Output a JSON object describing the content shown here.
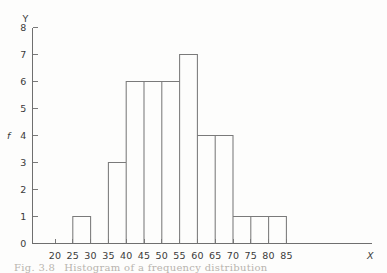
{
  "figure": {
    "caption_prefix": "Fig. 3.8",
    "caption_text": "Histogram of a frequency distribution",
    "background_color": "#fdfdfc",
    "line_color": "#7a7a7a"
  },
  "axes": {
    "y_axis_name": "Y",
    "y_series_name": "f",
    "x_axis_name": "X",
    "y_ticks": [
      "0",
      "1",
      "2",
      "3",
      "4",
      "5",
      "6",
      "7",
      "8"
    ],
    "x_ticks": [
      "20",
      "25",
      "30",
      "35",
      "40",
      "45",
      "50",
      "55",
      "60",
      "65",
      "70",
      "75",
      "80",
      "85"
    ]
  },
  "chart_data": {
    "type": "bar",
    "xlabel": "X",
    "ylabel": "f",
    "grid": false,
    "legend": "none",
    "bar_style": "outline",
    "bin_width": 5,
    "categories": [
      "20-25",
      "25-30",
      "30-35",
      "35-40",
      "40-45",
      "45-50",
      "50-55",
      "55-60",
      "60-65",
      "65-70",
      "70-75",
      "75-80",
      "80-85"
    ],
    "bin_edges": [
      20,
      25,
      30,
      35,
      40,
      45,
      50,
      55,
      60,
      65,
      70,
      75,
      80,
      85
    ],
    "values": [
      0,
      1,
      0,
      3,
      6,
      6,
      6,
      7,
      4,
      4,
      1,
      1,
      1
    ],
    "xlim": [
      17,
      88
    ],
    "ylim": [
      0,
      8
    ],
    "x_tick_values": [
      20,
      25,
      30,
      35,
      40,
      45,
      50,
      55,
      60,
      65,
      70,
      75,
      80,
      85
    ],
    "y_tick_values": [
      0,
      1,
      2,
      3,
      4,
      5,
      6,
      7,
      8
    ]
  }
}
